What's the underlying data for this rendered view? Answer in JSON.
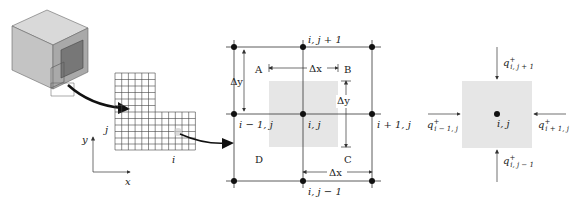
{
  "panel_left": {
    "axis_x_label": "x",
    "axis_y_label": "y",
    "grid_i_label": "i",
    "grid_j_label": "j"
  },
  "panel_middle": {
    "node_top": "i, j + 1",
    "node_left": "i − 1, j",
    "node_center": "i, j",
    "node_right": "i + 1, j",
    "node_bottom": "i, j − 1",
    "corner_a": "A",
    "corner_b": "B",
    "corner_c": "C",
    "corner_d": "D",
    "dx_top": "Δx",
    "dx_bottom": "Δx",
    "dy_left": "Δy",
    "dy_right": "Δy"
  },
  "panel_right": {
    "center_label": "i, j",
    "q_top": "q",
    "q_top_sub": "i, j + 1",
    "q_left": "q",
    "q_left_sub": "i − 1, j",
    "q_right": "q",
    "q_right_sub": "i + 1, j",
    "q_bottom": "q",
    "q_bottom_sub": "i, j − 1",
    "q_sup": "+"
  },
  "colors": {
    "line": "#333333",
    "cell_fill": "#e6e6e6",
    "cube_light": "#d6d6d6",
    "cube_mid": "#b9b9b9",
    "cube_dark": "#8a8a8a"
  }
}
